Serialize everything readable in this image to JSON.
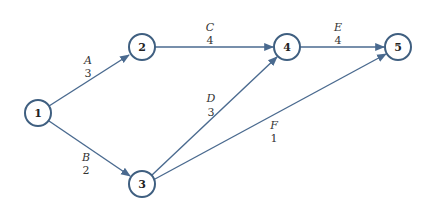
{
  "diagram": {
    "type": "activity-on-arrow network",
    "colors": {
      "node_stroke": "#3f5f80",
      "edge": "#4a6a8f",
      "text": "#333333"
    },
    "nodes": [
      {
        "id": "1",
        "label": "1",
        "x": 38,
        "y": 113
      },
      {
        "id": "2",
        "label": "2",
        "x": 142,
        "y": 47
      },
      {
        "id": "3",
        "label": "3",
        "x": 142,
        "y": 184
      },
      {
        "id": "4",
        "label": "4",
        "x": 287,
        "y": 47
      },
      {
        "id": "5",
        "label": "5",
        "x": 398,
        "y": 47
      }
    ],
    "edges": [
      {
        "from": "1",
        "to": "2",
        "activity": "A",
        "duration": "3"
      },
      {
        "from": "1",
        "to": "3",
        "activity": "B",
        "duration": "2"
      },
      {
        "from": "2",
        "to": "4",
        "activity": "C",
        "duration": "4"
      },
      {
        "from": "3",
        "to": "4",
        "activity": "D",
        "duration": "3"
      },
      {
        "from": "4",
        "to": "5",
        "activity": "E",
        "duration": "4"
      },
      {
        "from": "3",
        "to": "5",
        "activity": "F",
        "duration": "1"
      }
    ]
  }
}
